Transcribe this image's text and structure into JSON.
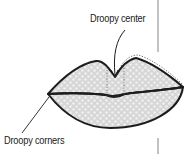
{
  "diagram": {
    "annotations": {
      "center": "Droopy center",
      "corners": "Droopy corners"
    },
    "colors": {
      "outline": "#1c1c1c",
      "fill": "#d9d9d9",
      "fill_dot": "#f2f2f2",
      "dotted_guide": "#555555",
      "divider": "#555555",
      "text": "#1a1a1a"
    }
  }
}
